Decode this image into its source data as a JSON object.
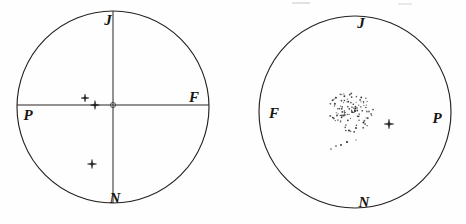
{
  "figure": {
    "background_color": "#fefefe",
    "ink_color": "#26211e",
    "width": 466,
    "height": 224
  },
  "panels": [
    {
      "id": "left-panel",
      "name": "left-field-circle",
      "center_x": 113,
      "center_y": 107,
      "radius": 96,
      "has_axes": true,
      "labels": {
        "top": "J",
        "right": "F",
        "bottom": "N",
        "left": "P"
      },
      "label_positions": {
        "top": {
          "x": 108,
          "y": 22
        },
        "right": {
          "x": 194,
          "y": 99
        },
        "bottom": {
          "x": 115,
          "y": 200
        },
        "left": {
          "x": 28,
          "y": 117
        }
      },
      "stars": [
        {
          "x": 85,
          "y": 98,
          "size": 4.0
        },
        {
          "x": 95,
          "y": 105,
          "size": 4.4
        },
        {
          "x": 92,
          "y": 164,
          "size": 4.6
        }
      ],
      "center_mark": {
        "x": 113,
        "y": 105,
        "r": 2.6
      },
      "cluster": null,
      "stray_dots": []
    },
    {
      "id": "right-panel",
      "name": "right-field-circle",
      "center_x": 355,
      "center_y": 112,
      "radius": 96,
      "has_axes": false,
      "labels": {
        "top": "J",
        "right": "P",
        "bottom": "N",
        "left": "F"
      },
      "label_positions": {
        "top": {
          "x": 361,
          "y": 25
        },
        "right": {
          "x": 437,
          "y": 120
        },
        "bottom": {
          "x": 364,
          "y": 204
        },
        "left": {
          "x": 274,
          "y": 115
        }
      },
      "stars": [
        {
          "x": 389,
          "y": 124,
          "size": 4.8
        }
      ],
      "center_mark": null,
      "cluster": {
        "name": "stippled-nebula-cluster",
        "center_x": 351,
        "center_y": 111,
        "radius_x": 22,
        "radius_y": 21,
        "dot_count": 112,
        "dot_radius": 0.72,
        "description": "dense stipple of small dots representing a resolved star cloud"
      },
      "stray_dots": [
        {
          "x": 336,
          "y": 146,
          "r": 0.8
        },
        {
          "x": 341,
          "y": 145,
          "r": 0.9
        },
        {
          "x": 347,
          "y": 142,
          "r": 1.1
        },
        {
          "x": 331,
          "y": 149,
          "r": 0.7
        },
        {
          "x": 356,
          "y": 140,
          "r": 0.6
        }
      ]
    }
  ],
  "legend": {
    "star_symbol_name": "star-marker",
    "dot_symbol_name": "stipple-dot"
  }
}
